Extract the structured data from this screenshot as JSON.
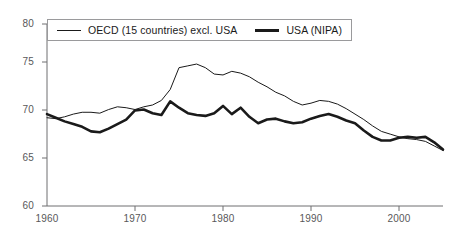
{
  "chart_data": {
    "type": "line",
    "title": "",
    "subtitle": "",
    "xlabel": "",
    "ylabel": "",
    "xlim": [
      1960,
      2005
    ],
    "ylim": [
      60,
      80
    ],
    "grid": false,
    "legend_position": "top-left",
    "x_ticks": [
      "1960",
      "1970",
      "1980",
      "1990",
      "2000"
    ],
    "x_tick_values": [
      1960,
      1970,
      1980,
      1990,
      2000
    ],
    "y_ticks": [
      "60",
      "65",
      "70",
      "75",
      "80"
    ],
    "y_tick_values": [
      60,
      65,
      70,
      75,
      80
    ],
    "x": [
      1960,
      1961,
      1962,
      1963,
      1964,
      1965,
      1966,
      1967,
      1968,
      1969,
      1970,
      1971,
      1972,
      1973,
      1974,
      1975,
      1976,
      1977,
      1978,
      1979,
      1980,
      1981,
      1982,
      1983,
      1984,
      1985,
      1986,
      1987,
      1988,
      1989,
      1990,
      1991,
      1992,
      1993,
      1994,
      1995,
      1996,
      1997,
      1998,
      1999,
      2000,
      2001,
      2002,
      2003,
      2004,
      2005
    ],
    "series": [
      {
        "name": "OECD (15 countries) excl. USA",
        "style": "thin",
        "color": "#1a1a1a",
        "values": [
          69.7,
          69.6,
          69.8,
          70.1,
          70.3,
          70.3,
          70.2,
          70.6,
          70.9,
          70.8,
          70.6,
          70.9,
          71.1,
          71.6,
          72.8,
          75.2,
          75.4,
          75.6,
          75.2,
          74.5,
          74.4,
          74.8,
          74.6,
          74.2,
          73.6,
          73.1,
          72.5,
          72.1,
          71.5,
          71.1,
          71.3,
          71.6,
          71.5,
          71.2,
          70.7,
          70.1,
          69.5,
          68.8,
          68.2,
          67.9,
          67.6,
          67.4,
          67.3,
          67.1,
          66.6,
          66.1
        ]
      },
      {
        "name": "USA (NIPA)",
        "style": "thick",
        "color": "#1a1a1a",
        "values": [
          70.1,
          69.7,
          69.3,
          69.0,
          68.7,
          68.2,
          68.1,
          68.5,
          69.0,
          69.5,
          70.5,
          70.6,
          70.2,
          70.0,
          71.5,
          70.8,
          70.2,
          70.0,
          69.9,
          70.2,
          71.0,
          70.1,
          70.8,
          69.8,
          69.1,
          69.5,
          69.6,
          69.3,
          69.1,
          69.2,
          69.6,
          69.9,
          70.1,
          69.8,
          69.4,
          69.1,
          68.3,
          67.6,
          67.2,
          67.2,
          67.5,
          67.6,
          67.5,
          67.6,
          67.0,
          66.2
        ]
      }
    ]
  },
  "legend": {
    "entries": [
      {
        "label": "OECD (15 countries) excl. USA",
        "style": "thin"
      },
      {
        "label": "USA (NIPA)",
        "style": "thick"
      }
    ]
  },
  "axes": {
    "y_labels": [
      "80",
      "75",
      "70",
      "65",
      "60"
    ],
    "x_labels": [
      "1960",
      "1970",
      "1980",
      "1990",
      "2000"
    ]
  },
  "colors": {
    "line": "#1a1a1a",
    "axis": "#6e6e70",
    "tick_text": "#58585a",
    "legend_border": "#9a9a9c",
    "background": "#ffffff"
  }
}
